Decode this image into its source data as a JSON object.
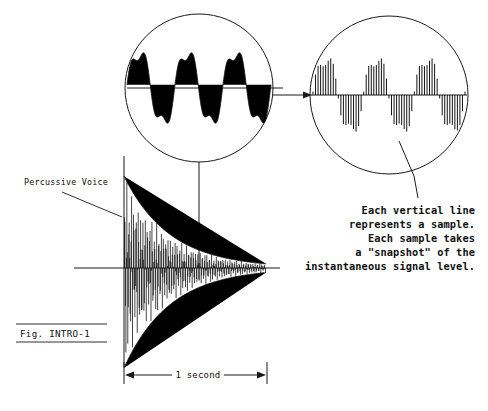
{
  "figure": {
    "caption": "Fig. INTRO-1",
    "source_label": "Percussive Voice",
    "duration_label": "1 second",
    "callout_lines": [
      "Each vertical line",
      "represents a sample.",
      "Each sample takes",
      "a \"snapshot\" of the",
      "instantaneous signal level."
    ],
    "colors": {
      "ink": "#1a1a1a",
      "background": "#ffffff"
    },
    "icons": {
      "flow_arrow": "arrow-right-icon",
      "dimension_arrow_left": "arrow-left-icon",
      "dimension_arrow_right": "arrow-right-icon"
    }
  },
  "chart_data": {
    "type": "line",
    "title": "Fig. INTRO-1",
    "xlabel": "1 second",
    "ylabel": "",
    "grid": false,
    "legend": "none",
    "panels": [
      {
        "name": "percussive-voice-waveform",
        "type": "line",
        "description": "Percussive voice envelope: exponentially decaying oscillation over 1 second, asymmetric with larger negative excursions.",
        "xlim": [
          0,
          1
        ],
        "ylim": [
          -1,
          1
        ],
        "envelope": {
          "model": "exponential-decay",
          "positive_peak": 0.82,
          "negative_peak": 1.0,
          "decay_constant": 3.1,
          "cycles": 62
        }
      },
      {
        "name": "analog-waveform-detail",
        "type": "line",
        "description": "Zoomed analog waveform inside left circle: smooth continuous wave, about 3 cycles.",
        "cycles": 3,
        "amplitude": 0.78,
        "continuous": true
      },
      {
        "name": "sampled-waveform-detail",
        "type": "bar",
        "description": "Zoomed digital samples inside right circle: same wave rendered as discrete vertical sample lines.",
        "cycles": 3,
        "amplitude": 0.78,
        "sample_count": 60,
        "continuous": false
      }
    ]
  }
}
